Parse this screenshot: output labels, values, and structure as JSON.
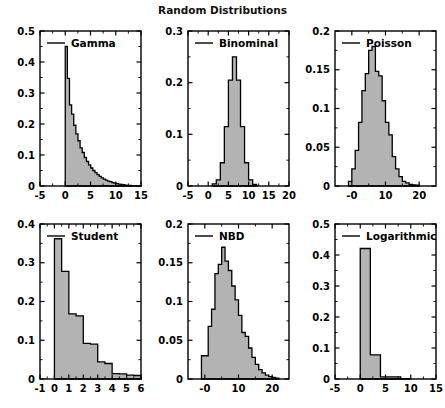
{
  "figure": {
    "title": "Random Distributions",
    "width": 445,
    "height": 408,
    "background": "#ffffff",
    "fill_color": "#b3b3b3",
    "edge_color": "#000000",
    "rows": 2,
    "cols": 3
  },
  "chart_data": [
    {
      "type": "bar",
      "title": "",
      "legend": "Gamma",
      "legend_position": "upper-left",
      "xlabel": "",
      "ylabel": "",
      "xlim": [
        -5,
        15
      ],
      "ylim": [
        0,
        0.5
      ],
      "xticks": [
        -5,
        0,
        5,
        10,
        15
      ],
      "xticklabels": [
        "-5",
        "0",
        "5",
        "10",
        "15"
      ],
      "yticks": [
        0,
        0.1,
        0.2,
        0.3,
        0.4,
        0.5
      ],
      "yticklabels": [
        "0",
        "0.1",
        "0.2",
        "0.3",
        "0.4",
        "0.5"
      ],
      "grid": false,
      "bin_width": 0.42,
      "bin_start": 0.0,
      "values": [
        0.45,
        0.347,
        0.262,
        0.232,
        0.196,
        0.168,
        0.146,
        0.123,
        0.108,
        0.092,
        0.079,
        0.068,
        0.058,
        0.05,
        0.043,
        0.037,
        0.031,
        0.026,
        0.022,
        0.019,
        0.016,
        0.014,
        0.011,
        0.009,
        0.0075,
        0.006,
        0.005,
        0.004,
        0.003,
        0.0022,
        0.0016,
        0.0011,
        0.0008,
        0.0005,
        0.0003,
        0.0002
      ]
    },
    {
      "type": "bar",
      "title": "",
      "legend": "Binominal",
      "legend_position": "upper-left",
      "xlabel": "",
      "ylabel": "",
      "xlim": [
        -5,
        20
      ],
      "ylim": [
        0,
        0.3
      ],
      "xticks": [
        -5,
        0,
        5,
        10,
        15,
        20
      ],
      "xticklabels": [
        "-5",
        "0",
        "5",
        "10",
        "15",
        "20"
      ],
      "yticks": [
        0,
        0.1,
        0.2,
        0.3
      ],
      "yticklabels": [
        "0",
        "0.1",
        "0.2",
        "0.3"
      ],
      "grid": false,
      "bin_width": 1.0,
      "bin_start": 1.0,
      "values": [
        0.004,
        0.012,
        0.045,
        0.115,
        0.205,
        0.25,
        0.205,
        0.115,
        0.045,
        0.012,
        0.003
      ]
    },
    {
      "type": "bar",
      "title": "",
      "legend": "Poisson",
      "legend_position": "upper-left",
      "xlabel": "",
      "ylabel": "",
      "xlim": [
        -5,
        25
      ],
      "ylim": [
        0,
        0.2
      ],
      "xticks": [
        0,
        10,
        20
      ],
      "xticklabels": [
        "-0",
        "10",
        "20"
      ],
      "yticks": [
        0,
        0.05,
        0.1,
        0.15,
        0.2
      ],
      "yticklabels": [
        "0",
        "0.05",
        "0.1",
        "0.15",
        "0.2"
      ],
      "grid": false,
      "bin_width": 1.0,
      "bin_start": -1.0,
      "values": [
        0.006,
        0.022,
        0.046,
        0.082,
        0.123,
        0.145,
        0.175,
        0.18,
        0.148,
        0.142,
        0.11,
        0.082,
        0.066,
        0.038,
        0.022,
        0.012,
        0.006,
        0.004,
        0.002,
        0.0015,
        0.001
      ]
    },
    {
      "type": "bar",
      "title": "",
      "legend": "Student",
      "legend_position": "upper-left",
      "xlabel": "",
      "ylabel": "",
      "xlim": [
        -1,
        6
      ],
      "ylim": [
        0,
        0.4
      ],
      "xticks": [
        -1,
        0,
        1,
        2,
        3,
        4,
        5,
        6
      ],
      "xticklabels": [
        "-1",
        "0",
        "1",
        "2",
        "3",
        "4",
        "5",
        "6"
      ],
      "yticks": [
        0,
        0.1,
        0.2,
        0.3,
        0.4
      ],
      "yticklabels": [
        "0",
        "0.1",
        "0.2",
        "0.3",
        "0.4"
      ],
      "grid": false,
      "bin_width": 0.5,
      "bin_start": 0.0,
      "values": [
        0.362,
        0.278,
        0.168,
        0.163,
        0.092,
        0.09,
        0.044,
        0.04,
        0.014,
        0.013,
        0.01,
        0.009,
        0.004,
        0.002
      ]
    },
    {
      "type": "bar",
      "title": "",
      "legend": "NBD",
      "legend_position": "upper-left",
      "xlabel": "",
      "ylabel": "",
      "xlim": [
        -5,
        25
      ],
      "ylim": [
        0,
        0.2
      ],
      "xticks": [
        0,
        10,
        20
      ],
      "xticklabels": [
        "-0",
        "10",
        "20"
      ],
      "yticks": [
        0,
        0.05,
        0.1,
        0.15,
        0.2
      ],
      "yticklabels": [
        "0",
        "0.05",
        "0.1",
        "0.15",
        "0.2"
      ],
      "grid": false,
      "bin_width": 1.0,
      "bin_start": -1.0,
      "values": [
        0.03,
        0.03,
        0.068,
        0.09,
        0.136,
        0.148,
        0.17,
        0.152,
        0.14,
        0.12,
        0.102,
        0.082,
        0.06,
        0.055,
        0.04,
        0.028,
        0.019,
        0.012,
        0.008,
        0.005,
        0.003,
        0.002,
        0.001
      ]
    },
    {
      "type": "bar",
      "title": "",
      "legend": "Logarithmic",
      "legend_position": "upper-left",
      "xlabel": "",
      "ylabel": "",
      "xlim": [
        -5,
        15
      ],
      "ylim": [
        0,
        0.5
      ],
      "xticks": [
        -5,
        0,
        5,
        10,
        15
      ],
      "xticklabels": [
        "-5",
        "0",
        "5",
        "10",
        "15"
      ],
      "yticks": [
        0,
        0.1,
        0.2,
        0.3,
        0.4,
        0.5
      ],
      "yticklabels": [
        "0",
        "0.1",
        "0.2",
        "0.3",
        "0.4",
        "0.5"
      ],
      "grid": false,
      "bin_width": 2.0,
      "bin_start": 0.0,
      "values": [
        0.421,
        0.078,
        0.007,
        0.007,
        0.001
      ]
    }
  ]
}
